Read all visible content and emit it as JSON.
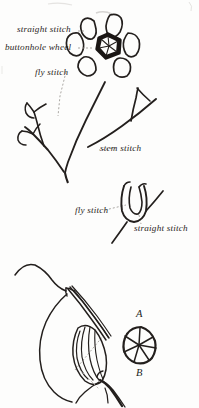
{
  "figure": {
    "kind": "embroidery-stitch-diagram",
    "background_color": "#fdfdfc",
    "ink_color": "#231f1d",
    "width": 199,
    "height": 408
  },
  "labels": {
    "straight_stitch_top": "straight stitch",
    "buttonhole_wheel": "buttonhole wheel",
    "fly_stitch_top": "fly stitch",
    "stem_stitch": "stem stitch",
    "fly_stitch_mid": "fly stitch",
    "straight_stitch_mid": "straight stitch",
    "marker_a": "A",
    "marker_b": "B"
  },
  "elements": {
    "flower": {
      "name": "buttonhole-wheel-flower",
      "petal_count": 6,
      "center": "buttonhole wheel",
      "center_spokes": 6
    },
    "left_sprig": {
      "name": "fly-stitch-sprig",
      "fly_stitch_arms": 2
    },
    "right_stem": {
      "name": "stem-stitch-branch",
      "branches": 2
    },
    "fly_loop": {
      "name": "fly-stitch-loop-detail"
    },
    "needle_detail": {
      "name": "needle-and-thread-detail"
    },
    "wheel_detail": {
      "name": "buttonhole-wheel-detail",
      "spokes": 6
    }
  }
}
